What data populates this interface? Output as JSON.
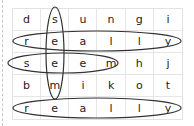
{
  "puzzle": {
    "type": "word-search",
    "rows": [
      [
        "d",
        "s",
        "u",
        "n",
        "g",
        "i"
      ],
      [
        "r",
        "e",
        "a",
        "l",
        "l",
        "y"
      ],
      [
        "s",
        "e",
        "e",
        "m",
        "h",
        "j"
      ],
      [
        "b",
        "m",
        "i",
        "k",
        "o",
        "t"
      ],
      [
        "r",
        "e",
        "a",
        "l",
        "l",
        "y"
      ]
    ],
    "found_words": [
      {
        "word": "seem",
        "direction": "vertical",
        "col": 1,
        "rows": [
          0,
          3
        ]
      },
      {
        "word": "really",
        "direction": "horizontal",
        "row": 1,
        "cols": [
          0,
          5
        ]
      },
      {
        "word": "seem",
        "direction": "horizontal",
        "row": 2,
        "cols": [
          0,
          3
        ]
      },
      {
        "word": "really",
        "direction": "horizontal",
        "row": 4,
        "cols": [
          0,
          5
        ]
      }
    ],
    "circle_color": "#333333"
  }
}
